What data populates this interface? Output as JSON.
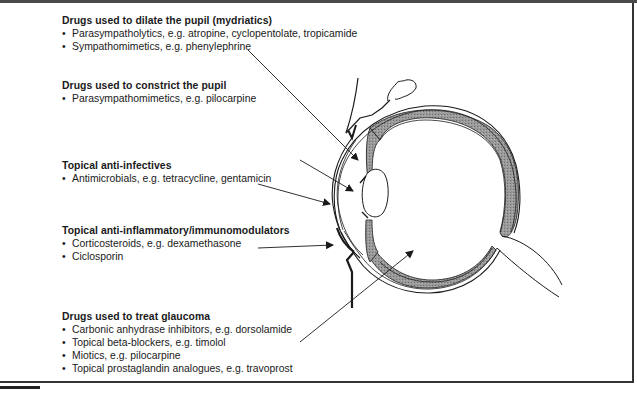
{
  "figure": {
    "type": "eye-cross-section-diagram",
    "colors": {
      "line": "#1a1a1a",
      "shading": "#8c8c8c",
      "frame": "#333333"
    }
  },
  "groups": [
    {
      "title": "Drugs used to dilate the pupil (mydriatics)",
      "items": [
        "Parasympatholytics, e.g. atropine, cyclopentolate, tropicamide",
        "Sympathomimetics, e.g. phenylephrine"
      ],
      "target": "iris"
    },
    {
      "title": "Drugs used to constrict the pupil",
      "items": [
        "Parasympathomimetics, e.g. pilocarpine"
      ],
      "target": "pupil"
    },
    {
      "title": "Topical anti-infectives",
      "items": [
        "Antimicrobials, e.g. tetracycline, gentamicin"
      ],
      "target": "cornea"
    },
    {
      "title": "Topical anti-inflammatory/immunomodulators",
      "items": [
        "Corticosteroids, e.g. dexamethasone",
        "Ciclosporin"
      ],
      "target": "conjunctiva"
    },
    {
      "title": "Drugs used to treat glaucoma",
      "items": [
        "Carbonic anhydrase inhibitors, e.g. dorsolamide",
        "Topical beta-blockers, e.g. timolol",
        "Miotics, e.g. pilocarpine",
        "Topical prostaglandin analogues, e.g. travoprost"
      ],
      "target": "intraocular"
    }
  ]
}
